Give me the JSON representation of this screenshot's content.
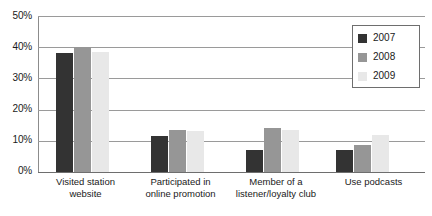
{
  "chart_data": {
    "type": "bar",
    "title": "",
    "subtitle": "",
    "xlabel": "",
    "ylabel": "",
    "ylim": [
      0,
      50
    ],
    "y_tick_labels": [
      "0%",
      "10%",
      "20%",
      "30%",
      "40%",
      "50%"
    ],
    "y_ticks": [
      0,
      10,
      20,
      30,
      40,
      50
    ],
    "grid": true,
    "legend_position": "top-right",
    "categories": [
      "Visited station website",
      "Participated in online promotion",
      "Member of a listener/loyalty club",
      "Use podcasts"
    ],
    "series": [
      {
        "name": "2007",
        "color": "#333333",
        "values": [
          38,
          11.5,
          7,
          7
        ]
      },
      {
        "name": "2008",
        "color": "#969696",
        "values": [
          40,
          13.5,
          14,
          8.5
        ]
      },
      {
        "name": "2009",
        "color": "#e8e8e8",
        "values": [
          38.5,
          13,
          13.5,
          12
        ]
      }
    ]
  },
  "category_lines": [
    [
      "Visited station",
      "website"
    ],
    [
      "Participated in",
      "online promotion"
    ],
    [
      "Member of a",
      "listener/loyalty club"
    ],
    [
      "Use podcasts",
      ""
    ]
  ],
  "legend": {
    "items": [
      {
        "label": "2007",
        "color": "#333333"
      },
      {
        "label": "2008",
        "color": "#969696"
      },
      {
        "label": "2009",
        "color": "#e8e8e8"
      }
    ]
  }
}
